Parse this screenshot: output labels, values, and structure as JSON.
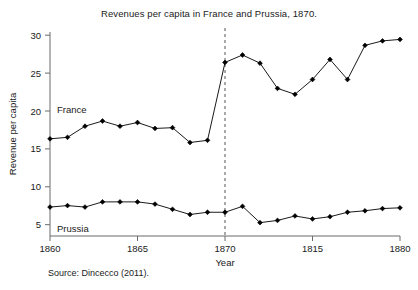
{
  "chart_data": {
    "type": "line",
    "title": "Revenues per capita in France and Prussia, 1870.",
    "xlabel": "Year",
    "ylabel": "Revenue per capita",
    "xlim": [
      1860,
      1880
    ],
    "ylim": [
      4,
      31.5
    ],
    "grid": false,
    "legend_position": "inline-annotations",
    "xticks": [
      1860,
      1865,
      1870,
      1875,
      1880
    ],
    "xtick_labels": [
      "1860",
      "1865",
      "1870",
      "1815",
      "1880"
    ],
    "yticks": [
      5,
      10,
      15,
      20,
      25,
      30
    ],
    "ytick_labels": [
      "5",
      "10",
      "15",
      "20",
      "25",
      "30"
    ],
    "x": [
      1860,
      1861,
      1862,
      1863,
      1864,
      1865,
      1866,
      1867,
      1868,
      1869,
      1870,
      1871,
      1872,
      1873,
      1874,
      1875,
      1876,
      1877,
      1878,
      1879,
      1880
    ],
    "series": [
      {
        "name": "France",
        "color": "#000000",
        "marker": "diamond",
        "values": [
          17.1,
          17.3,
          18.8,
          19.5,
          18.8,
          19.3,
          18.5,
          18.6,
          16.6,
          16.9,
          27.4,
          28.4,
          27.3,
          23.9,
          23.1,
          25.1,
          27.8,
          25.1,
          29.7,
          30.3,
          30.5
        ]
      },
      {
        "name": "Prussia",
        "color": "#000000",
        "marker": "diamond",
        "values": [
          7.9,
          8.1,
          7.9,
          8.6,
          8.6,
          8.6,
          8.3,
          7.6,
          6.9,
          7.2,
          7.2,
          8.0,
          5.8,
          6.1,
          6.7,
          6.3,
          6.6,
          7.2,
          7.4,
          7.7,
          7.8
        ]
      }
    ],
    "annotations": [
      {
        "text": "France",
        "x": 1860.4,
        "y": 20.4
      },
      {
        "text": "Prussia",
        "x": 1860.4,
        "y": 5.1
      }
    ],
    "reference_line": {
      "orientation": "vertical",
      "x": 1870,
      "style": "dashed",
      "color": "#555555"
    },
    "source_note": "Source: Dincecco (2011)."
  }
}
